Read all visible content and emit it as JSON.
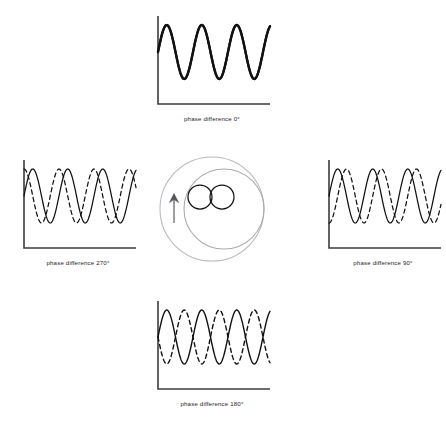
{
  "figure": {
    "name": "two-source-interference-phase-difference-diagram",
    "background": "#ffffff",
    "width": 435,
    "height": 429
  },
  "style": {
    "axis_color": "#3c3c3c",
    "solid_wave_color": "#111111",
    "dashed_wave_color": "#111111",
    "outer_circle_color": "#b9b9bd",
    "inner_circle_color": "#a9a9ae",
    "source_circle_color": "#121212",
    "arrow_color": "#55555a",
    "caption_color": "#262626"
  },
  "panels": [
    {
      "id": "top",
      "position": "top",
      "caption": "phase difference 0°",
      "phase_difference_deg": 0,
      "waves": [
        {
          "name": "wave-a",
          "style": "solid",
          "phase_deg": 0,
          "linewidth": 2.3
        },
        {
          "name": "wave-b",
          "style": "solid",
          "phase_deg": 0,
          "linewidth": 2.3
        }
      ]
    },
    {
      "id": "left",
      "position": "left",
      "caption": "phase difference 270°",
      "phase_difference_deg": 270,
      "waves": [
        {
          "name": "wave-a",
          "style": "solid",
          "phase_deg": 0,
          "linewidth": 1.25
        },
        {
          "name": "wave-b",
          "style": "dashed",
          "phase_deg": 270,
          "linewidth": 1.25
        }
      ]
    },
    {
      "id": "right",
      "position": "right",
      "caption": "phase difference 90°",
      "phase_difference_deg": 90,
      "waves": [
        {
          "name": "wave-a",
          "style": "solid",
          "phase_deg": 0,
          "linewidth": 1.25
        },
        {
          "name": "wave-b",
          "style": "dashed",
          "phase_deg": 90,
          "linewidth": 1.25
        }
      ]
    },
    {
      "id": "bottom",
      "position": "bottom",
      "caption": "phase difference 180°",
      "phase_difference_deg": 180,
      "waves": [
        {
          "name": "wave-a",
          "style": "solid",
          "phase_deg": 0,
          "linewidth": 1.4
        },
        {
          "name": "wave-b",
          "style": "dashed",
          "phase_deg": 180,
          "linewidth": 1.4
        }
      ]
    }
  ],
  "source_diagram": {
    "name": "wave-source-diagram",
    "elements": [
      {
        "name": "outer-wavefront-circle",
        "shape": "circle",
        "cx": 60,
        "cy": 57,
        "r": 52
      },
      {
        "name": "inner-wavefront-circle",
        "shape": "circle",
        "cx": 72,
        "cy": 57,
        "r": 40
      },
      {
        "name": "source-circle-left",
        "shape": "circle",
        "cx": 48,
        "cy": 45,
        "r": 12
      },
      {
        "name": "source-circle-right",
        "shape": "circle",
        "cx": 70,
        "cy": 45,
        "r": 12
      },
      {
        "name": "direction-arrow",
        "shape": "arrow",
        "from_y": 70,
        "to_y": 42,
        "x": 22
      }
    ]
  },
  "chart_data": {
    "type": "line",
    "xlabel": "",
    "ylabel": "",
    "grid": false,
    "legend": "none",
    "axis_ranges": {
      "x": [
        0,
        3.2
      ],
      "y": [
        -1,
        1
      ]
    },
    "axis_units": {
      "x": "wave cycles",
      "y": "displacement (arbitrary)"
    },
    "common": {
      "amplitude": 1,
      "cycles_shown": 3.2,
      "samples_per_cycle": 64
    },
    "panels": [
      {
        "caption": "phase difference 0°",
        "phase_difference_deg": 0,
        "series": [
          {
            "name": "wave-a",
            "style": "solid",
            "phase_deg": 0,
            "amplitude": 1
          },
          {
            "name": "wave-b",
            "style": "solid",
            "phase_deg": 0,
            "amplitude": 1
          }
        ],
        "note": "waves coincide exactly; they appear as one thick line (constructive interference)"
      },
      {
        "caption": "phase difference 270°",
        "phase_difference_deg": 270,
        "series": [
          {
            "name": "wave-a",
            "style": "solid",
            "phase_deg": 0,
            "amplitude": 1
          },
          {
            "name": "wave-b",
            "style": "dashed",
            "phase_deg": 270,
            "amplitude": 1
          }
        ],
        "note": "dashed wave leads/lags by three quarters of a cycle"
      },
      {
        "caption": "phase difference 90°",
        "phase_difference_deg": 90,
        "series": [
          {
            "name": "wave-a",
            "style": "solid",
            "phase_deg": 0,
            "amplitude": 1
          },
          {
            "name": "wave-b",
            "style": "dashed",
            "phase_deg": 90,
            "amplitude": 1
          }
        ],
        "note": "dashed wave shifted by a quarter of a cycle"
      },
      {
        "caption": "phase difference 180°",
        "phase_difference_deg": 180,
        "series": [
          {
            "name": "wave-a",
            "style": "solid",
            "phase_deg": 0,
            "amplitude": 1
          },
          {
            "name": "wave-b",
            "style": "dashed",
            "phase_deg": 180,
            "amplitude": 1
          }
        ],
        "note": "waves exactly antiphase (destructive interference)"
      }
    ]
  }
}
